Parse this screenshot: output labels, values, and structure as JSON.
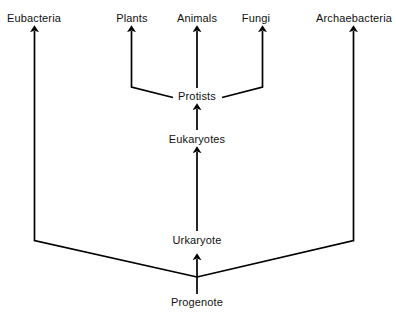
{
  "diagram": {
    "type": "tree-diagram",
    "background_color": "#ffffff",
    "line_color": "#000000",
    "text_color": "#111111",
    "canvas": {
      "width": 396,
      "height": 319
    }
  },
  "nodes": [
    {
      "id": "eubacteria",
      "label": "Eubacteria",
      "x": 34,
      "y": 18,
      "rank": "domain"
    },
    {
      "id": "plants",
      "label": "Plants",
      "x": 132,
      "y": 18,
      "rank": "kingdom"
    },
    {
      "id": "animals",
      "label": "Animals",
      "x": 197,
      "y": 18,
      "rank": "kingdom"
    },
    {
      "id": "fungi",
      "label": "Fungi",
      "x": 256,
      "y": 18,
      "rank": "kingdom"
    },
    {
      "id": "archaebacteria",
      "label": "Archaebacteria",
      "x": 354,
      "y": 18,
      "rank": "domain"
    },
    {
      "id": "protists",
      "label": "Protists",
      "x": 197,
      "y": 96,
      "rank": "kingdom"
    },
    {
      "id": "eukaryotes",
      "label": "Eukaryotes",
      "x": 197,
      "y": 139,
      "rank": "domain"
    },
    {
      "id": "urkaryote",
      "label": "Urkaryote",
      "x": 197,
      "y": 240,
      "rank": "ancestor"
    },
    {
      "id": "progenote",
      "label": "Progenote",
      "x": 197,
      "y": 302,
      "rank": "root"
    }
  ],
  "edges": [
    {
      "from": "protists",
      "to": "plants",
      "style": "elbow-arrow"
    },
    {
      "from": "protists",
      "to": "animals",
      "style": "straight-arrow"
    },
    {
      "from": "protists",
      "to": "fungi",
      "style": "elbow-arrow"
    },
    {
      "from": "eukaryotes",
      "to": "protists",
      "style": "straight-arrow"
    },
    {
      "from": "urkaryote",
      "to": "eukaryotes",
      "style": "straight-arrow"
    },
    {
      "from": "progenote",
      "to": "urkaryote",
      "style": "straight-arrow"
    },
    {
      "from": "progenote",
      "to": "eubacteria",
      "style": "diagonal-elbow-arrow"
    },
    {
      "from": "progenote",
      "to": "archaebacteria",
      "style": "diagonal-elbow-arrow"
    }
  ]
}
